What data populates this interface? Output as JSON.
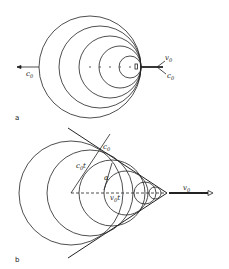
{
  "panel_a": {
    "label": "a",
    "left_arrow_label": "c",
    "left_arrow_sub": "0",
    "velocity_label": "v",
    "velocity_sub": "0",
    "right_arrow_label": "c",
    "right_arrow_sub": "0",
    "circle_count": 5
  },
  "panel_b": {
    "label": "b",
    "cone_edge_label": "c",
    "cone_edge_sub": "0",
    "radius_label": "c",
    "radius_sub": "0",
    "radius_t": "t",
    "angle_label": "α",
    "displacement_label": "v",
    "displacement_sub": "0",
    "displacement_t": "t",
    "velocity_label": "v",
    "velocity_sub": "0",
    "circle_count": 6
  }
}
